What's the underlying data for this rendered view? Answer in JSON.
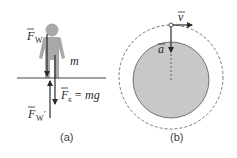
{
  "panel_a": {
    "caption": "(a)",
    "labels": {
      "fw": "F",
      "fw_sub": "W",
      "mass": "m",
      "fg": "F",
      "fg_sub": "g",
      "fg_eq": "= mg",
      "fw_prime": "F",
      "fw_prime_sub": "W",
      "fw_prime_mark": "′"
    }
  },
  "panel_b": {
    "caption": "(b)",
    "labels": {
      "velocity": "v",
      "acceleration": "a"
    }
  },
  "colors": {
    "figure_gray": "#a8a8a8",
    "disk_fill": "#c8c8c8",
    "line": "#2a2a2a",
    "dashed": "#555555"
  }
}
